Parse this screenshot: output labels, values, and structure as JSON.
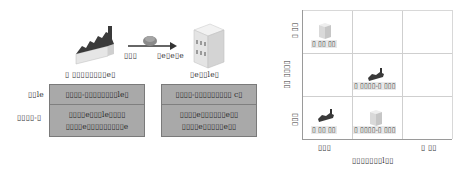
{
  "flow": {
    "source_label": "▯ ▯▯▯▯▯▯▯▯e▯",
    "target_label": "▯e▯▯le▯",
    "arrow_left_label": "▯▯▯",
    "arrow_right_label": "▯e▯e▯e",
    "icons": {
      "source": "factory-icon",
      "target": "office-building-icon",
      "transfer": "cargo-pile-icon"
    }
  },
  "comparison": {
    "row_labels": [
      "▯▯le",
      "▯▯▯▯-▯"
    ],
    "left_box": {
      "header": "▯▯▯▯-▯▯▯▯▯▯▯▯le▯",
      "lines": [
        "▯▯▯▯e▯▯▯le▯▯▯▯",
        "▯▯▯▯e▯▯▯▯▯▯▯▯▯e"
      ]
    },
    "right_box": {
      "header": "▯▯▯▯-▯▯▯▯▯▯▯▯▯ c▯",
      "lines": [
        "▯▯▯▯e▯▯▯▯▯▯e▯▯",
        "▯▯▯▯e▯▯▯▯▯e▯▯"
      ]
    },
    "colors": {
      "box_fill": "#a9a9a9",
      "box_border": "#7a7a7a"
    }
  },
  "matrix": {
    "x_axis": {
      "title": "▯▯▯▯▯▯▯l▯▯",
      "low": "▯▯▯",
      "high": "▯ ▯▯"
    },
    "y_axis": {
      "title": "▯▯ ▯▯▯▯",
      "low": "▯▯▯",
      "high": "▯ ▯▯"
    },
    "cells": [
      {
        "row": 0,
        "col": 0,
        "icon": "office-building-icon",
        "label": "▯ ▯▯ ▯▯"
      },
      {
        "row": 1,
        "col": 1,
        "icon": "factory-icon",
        "label": "▯ ▯▯▯▯-▯ ▯▯▯"
      },
      {
        "row": 2,
        "col": 0,
        "icon": "factory-icon",
        "label": "▯ ▯▯ ▯▯"
      },
      {
        "row": 2,
        "col": 1,
        "icon": "office-building-icon",
        "label": "▯ ▯▯▯▯-▯ ▯▯▯"
      }
    ],
    "grid_color": "#cfcfcf"
  }
}
